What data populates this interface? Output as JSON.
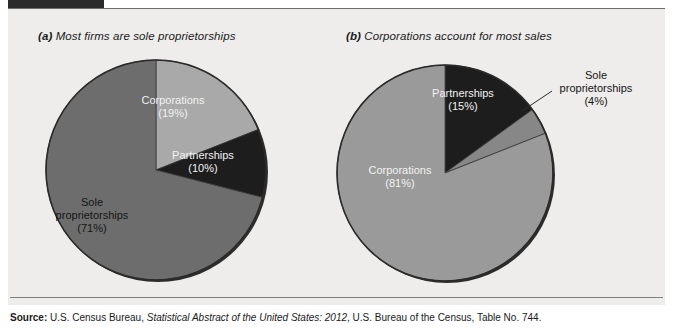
{
  "figure": {
    "background_color": "#eeedeb",
    "header_ghost_text": "",
    "source": {
      "label": "Source:",
      "text_before_italic": " U.S. Census Bureau, ",
      "italic_text": "Statistical Abstract of the United States: 2012",
      "text_after_italic": ", U.S. Bureau of the Census, Table No. 744."
    }
  },
  "charts": [
    {
      "panel_letter": "(a)",
      "title": "Most firms are sole proprietorships",
      "center": {
        "x": 148,
        "y": 161
      },
      "radius": 109,
      "slices": [
        {
          "label": "Corporations",
          "percent_text": "(19%)",
          "value": 19,
          "color": "#a9a9a9",
          "label_color": "light"
        },
        {
          "label": "Partnerships",
          "percent_text": "(10%)",
          "value": 10,
          "color": "#1d1d1d",
          "label_color": "light"
        },
        {
          "label": "Sole proprietorships",
          "percent_text": "(71%)",
          "value": 71,
          "color": "#6d6d6d",
          "label_color": "dark"
        }
      ]
    },
    {
      "panel_letter": "(b)",
      "title": "Corporations account for most sales",
      "center": {
        "x": 437,
        "y": 165
      },
      "radius": 107,
      "slices": [
        {
          "label": "Partnerships",
          "percent_text": "(15%)",
          "value": 15,
          "color": "#1d1d1d",
          "label_color": "light"
        },
        {
          "label": "Sole proprietorships",
          "percent_text": "(4%)",
          "value": 4,
          "color": "#878787",
          "label_color": "dark"
        },
        {
          "label": "Corporations",
          "percent_text": "(81%)",
          "value": 81,
          "color": "#9a9a9a",
          "label_color": "light"
        }
      ]
    }
  ],
  "chart_data": [
    {
      "type": "pie",
      "title": "(a) Most firms are sole proprietorships",
      "categories": [
        "Corporations",
        "Partnerships",
        "Sole proprietorships"
      ],
      "values": [
        19,
        10,
        71
      ],
      "unit": "percent",
      "data_labels": [
        "Corporations (19%)",
        "Partnerships (10%)",
        "Sole proprietorships (71%)"
      ],
      "colors": [
        "#a9a9a9",
        "#1d1d1d",
        "#6d6d6d"
      ],
      "start_angle_deg": 0,
      "direction": "clockwise",
      "legend": "none",
      "xlabel": "",
      "ylabel": ""
    },
    {
      "type": "pie",
      "title": "(b) Corporations account for most sales",
      "categories": [
        "Partnerships",
        "Sole proprietorships",
        "Corporations"
      ],
      "values": [
        15,
        4,
        81
      ],
      "unit": "percent",
      "data_labels": [
        "Partnerships (15%)",
        "Sole proprietorships (4%)",
        "Corporations (81%)"
      ],
      "colors": [
        "#1d1d1d",
        "#878787",
        "#9a9a9a"
      ],
      "start_angle_deg": 0,
      "direction": "clockwise",
      "legend": "none",
      "xlabel": "",
      "ylabel": ""
    }
  ],
  "labels": {
    "a_corporations_l1": "Corporations",
    "a_corporations_l2": "(19%)",
    "a_partnerships_l1": "Partnerships",
    "a_partnerships_l2": "(10%)",
    "a_sole_l1": "Sole",
    "a_sole_l2": "proprietorships",
    "a_sole_l3": "(71%)",
    "b_partnerships_l1": "Partnerships",
    "b_partnerships_l2": "(15%)",
    "b_sole_l1": "Sole",
    "b_sole_l2": "proprietorships",
    "b_sole_l3": "(4%)",
    "b_corporations_l1": "Corporations",
    "b_corporations_l2": "(81%)"
  }
}
